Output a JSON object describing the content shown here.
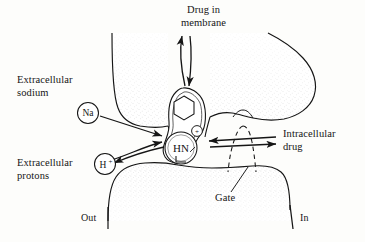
{
  "figure": {
    "background_color": "#fdfdfb",
    "ink_color": "#151515",
    "membrane_fill": "#ffffff",
    "stipple_color": "#5a5a5a"
  },
  "labels": {
    "drug_in_membrane": "Drug in\nmembrane",
    "extracellular_sodium": "Extracellular\nsodium",
    "extracellular_protons": "Extracellular\nprotons",
    "intracellular_drug": "Intracellular\ndrug",
    "gate": "Gate",
    "out": "Out",
    "in": "In"
  },
  "ions": {
    "sodium": "Na",
    "proton": "H",
    "proton_charge": "+"
  },
  "molecule": {
    "amine_label": "HN",
    "charge_label": "+",
    "ring_name": "benzene-ring"
  },
  "icons": {
    "membrane": "membrane-icon",
    "gate": "gate-icon",
    "drug_molecule": "drug-molecule-icon",
    "arrow_up": "arrow-up-icon",
    "arrow_down": "arrow-down-icon",
    "arrow_in": "arrow-right-icon",
    "arrow_out": "arrow-left-icon"
  }
}
